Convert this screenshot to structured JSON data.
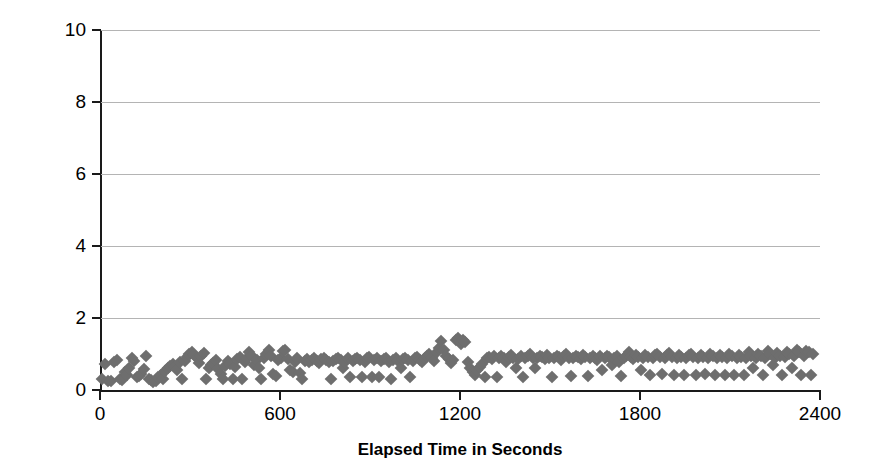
{
  "chart_data": {
    "type": "scatter",
    "title": "",
    "xlabel": "Elapsed Time in Seconds",
    "ylabel": "Maximum Cycle Time in Msec.",
    "xlim": [
      0,
      2400
    ],
    "ylim": [
      0,
      10
    ],
    "xticks": [
      0,
      600,
      1200,
      1800,
      2400
    ],
    "yticks": [
      0,
      2,
      4,
      6,
      8,
      10
    ],
    "xtick_labels": [
      "0",
      "600",
      "1200",
      "1800",
      "2400"
    ],
    "ytick_labels": [
      "0",
      "2",
      "4",
      "6",
      "8",
      "10"
    ],
    "grid": "horizontal",
    "legend": "none",
    "marker": "diamond",
    "marker_color": "#6e6e6e",
    "gridline_color": "#b4b4b4",
    "axis_color": "#1a1a1a",
    "background_color": "#ffffff",
    "series": [
      {
        "name": "Maximum Cycle Time",
        "points": [
          [
            8,
            0.3
          ],
          [
            18,
            0.72
          ],
          [
            28,
            0.25
          ],
          [
            38,
            0.25
          ],
          [
            48,
            0.78
          ],
          [
            58,
            0.82
          ],
          [
            66,
            0.3
          ],
          [
            74,
            0.28
          ],
          [
            82,
            0.5
          ],
          [
            90,
            0.42
          ],
          [
            98,
            0.62
          ],
          [
            106,
            0.88
          ],
          [
            114,
            0.8
          ],
          [
            122,
            0.35
          ],
          [
            130,
            0.4
          ],
          [
            138,
            0.45
          ],
          [
            146,
            0.58
          ],
          [
            154,
            0.95
          ],
          [
            162,
            0.3
          ],
          [
            170,
            0.28
          ],
          [
            178,
            0.22
          ],
          [
            186,
            0.25
          ],
          [
            194,
            0.35
          ],
          [
            202,
            0.42
          ],
          [
            210,
            0.3
          ],
          [
            218,
            0.52
          ],
          [
            226,
            0.6
          ],
          [
            234,
            0.68
          ],
          [
            242,
            0.72
          ],
          [
            250,
            0.65
          ],
          [
            258,
            0.55
          ],
          [
            266,
            0.78
          ],
          [
            274,
            0.3
          ],
          [
            282,
            0.8
          ],
          [
            290,
            0.92
          ],
          [
            298,
            1.0
          ],
          [
            306,
            1.05
          ],
          [
            314,
            0.98
          ],
          [
            322,
            0.88
          ],
          [
            330,
            0.75
          ],
          [
            338,
            0.95
          ],
          [
            346,
            1.02
          ],
          [
            354,
            0.3
          ],
          [
            362,
            0.62
          ],
          [
            370,
            0.7
          ],
          [
            378,
            0.75
          ],
          [
            386,
            0.82
          ],
          [
            394,
            0.58
          ],
          [
            402,
            0.45
          ],
          [
            410,
            0.3
          ],
          [
            418,
            0.68
          ],
          [
            426,
            0.8
          ],
          [
            434,
            0.72
          ],
          [
            442,
            0.3
          ],
          [
            450,
            0.65
          ],
          [
            458,
            0.85
          ],
          [
            466,
            0.92
          ],
          [
            474,
            0.3
          ],
          [
            482,
            0.78
          ],
          [
            490,
            0.88
          ],
          [
            498,
            1.05
          ],
          [
            506,
            0.95
          ],
          [
            514,
            0.7
          ],
          [
            522,
            0.82
          ],
          [
            530,
            0.6
          ],
          [
            538,
            0.3
          ],
          [
            546,
            0.88
          ],
          [
            554,
            1.0
          ],
          [
            562,
            1.1
          ],
          [
            570,
            0.95
          ],
          [
            578,
            0.45
          ],
          [
            586,
            0.4
          ],
          [
            594,
            0.82
          ],
          [
            602,
            0.9
          ],
          [
            610,
            1.08
          ],
          [
            618,
            1.12
          ],
          [
            626,
            0.85
          ],
          [
            634,
            0.55
          ],
          [
            642,
            0.5
          ],
          [
            650,
            0.78
          ],
          [
            658,
            0.88
          ],
          [
            666,
            0.48
          ],
          [
            674,
            0.3
          ],
          [
            682,
            0.8
          ],
          [
            690,
            0.85
          ],
          [
            698,
            0.78
          ],
          [
            706,
            0.82
          ],
          [
            714,
            0.88
          ],
          [
            722,
            0.8
          ],
          [
            730,
            0.75
          ],
          [
            738,
            0.85
          ],
          [
            746,
            0.9
          ],
          [
            754,
            0.82
          ],
          [
            762,
            0.78
          ],
          [
            770,
            0.3
          ],
          [
            778,
            0.8
          ],
          [
            786,
            0.85
          ],
          [
            794,
            0.88
          ],
          [
            802,
            0.82
          ],
          [
            810,
            0.6
          ],
          [
            818,
            0.78
          ],
          [
            826,
            0.88
          ],
          [
            834,
            0.35
          ],
          [
            842,
            0.8
          ],
          [
            850,
            0.85
          ],
          [
            858,
            0.9
          ],
          [
            866,
            0.82
          ],
          [
            874,
            0.35
          ],
          [
            882,
            0.78
          ],
          [
            890,
            0.88
          ],
          [
            898,
            0.92
          ],
          [
            906,
            0.35
          ],
          [
            914,
            0.82
          ],
          [
            922,
            0.88
          ],
          [
            930,
            0.35
          ],
          [
            938,
            0.8
          ],
          [
            946,
            0.85
          ],
          [
            954,
            0.9
          ],
          [
            962,
            0.78
          ],
          [
            970,
            0.3
          ],
          [
            978,
            0.82
          ],
          [
            986,
            0.88
          ],
          [
            994,
            0.8
          ],
          [
            1002,
            0.62
          ],
          [
            1010,
            0.85
          ],
          [
            1018,
            0.9
          ],
          [
            1026,
            0.82
          ],
          [
            1034,
            0.35
          ],
          [
            1042,
            0.8
          ],
          [
            1050,
            0.88
          ],
          [
            1058,
            0.92
          ],
          [
            1066,
            0.82
          ],
          [
            1074,
            0.78
          ],
          [
            1082,
            0.88
          ],
          [
            1090,
            0.95
          ],
          [
            1098,
            1.0
          ],
          [
            1106,
            0.88
          ],
          [
            1114,
            0.8
          ],
          [
            1122,
            1.05
          ],
          [
            1130,
            1.18
          ],
          [
            1138,
            1.35
          ],
          [
            1146,
            1.1
          ],
          [
            1154,
            0.95
          ],
          [
            1162,
            0.85
          ],
          [
            1170,
            0.75
          ],
          [
            1178,
            0.82
          ],
          [
            1186,
            1.4
          ],
          [
            1194,
            1.45
          ],
          [
            1202,
            1.28
          ],
          [
            1210,
            1.38
          ],
          [
            1218,
            1.32
          ],
          [
            1226,
            0.78
          ],
          [
            1234,
            0.6
          ],
          [
            1242,
            0.5
          ],
          [
            1250,
            0.42
          ],
          [
            1258,
            0.55
          ],
          [
            1266,
            0.65
          ],
          [
            1274,
            0.72
          ],
          [
            1282,
            0.35
          ],
          [
            1290,
            0.88
          ],
          [
            1298,
            0.92
          ],
          [
            1306,
            0.85
          ],
          [
            1314,
            0.95
          ],
          [
            1322,
            0.35
          ],
          [
            1330,
            0.9
          ],
          [
            1338,
            0.95
          ],
          [
            1346,
            0.88
          ],
          [
            1354,
            0.78
          ],
          [
            1362,
            0.92
          ],
          [
            1370,
            0.98
          ],
          [
            1378,
            0.9
          ],
          [
            1386,
            0.62
          ],
          [
            1394,
            0.85
          ],
          [
            1402,
            0.95
          ],
          [
            1410,
            0.35
          ],
          [
            1418,
            0.88
          ],
          [
            1426,
            0.95
          ],
          [
            1434,
            1.0
          ],
          [
            1442,
            0.9
          ],
          [
            1450,
            0.6
          ],
          [
            1458,
            0.88
          ],
          [
            1466,
            0.95
          ],
          [
            1474,
            0.92
          ],
          [
            1482,
            0.85
          ],
          [
            1490,
            0.98
          ],
          [
            1498,
            0.9
          ],
          [
            1506,
            0.35
          ],
          [
            1514,
            0.88
          ],
          [
            1522,
            0.95
          ],
          [
            1530,
            0.92
          ],
          [
            1538,
            0.82
          ],
          [
            1546,
            0.95
          ],
          [
            1554,
            1.0
          ],
          [
            1562,
            0.9
          ],
          [
            1570,
            0.38
          ],
          [
            1578,
            0.88
          ],
          [
            1586,
            0.95
          ],
          [
            1594,
            0.92
          ],
          [
            1602,
            0.85
          ],
          [
            1610,
            0.98
          ],
          [
            1618,
            0.92
          ],
          [
            1626,
            0.38
          ],
          [
            1634,
            0.88
          ],
          [
            1642,
            0.95
          ],
          [
            1650,
            0.9
          ],
          [
            1658,
            0.82
          ],
          [
            1666,
            0.95
          ],
          [
            1674,
            0.55
          ],
          [
            1682,
            0.88
          ],
          [
            1690,
            0.95
          ],
          [
            1698,
            0.92
          ],
          [
            1706,
            0.7
          ],
          [
            1714,
            0.88
          ],
          [
            1722,
            0.95
          ],
          [
            1730,
            0.78
          ],
          [
            1738,
            0.4
          ],
          [
            1746,
            0.88
          ],
          [
            1754,
            0.95
          ],
          [
            1762,
            1.05
          ],
          [
            1770,
            0.92
          ],
          [
            1778,
            0.85
          ],
          [
            1786,
            0.98
          ],
          [
            1794,
            0.92
          ],
          [
            1802,
            0.55
          ],
          [
            1810,
            0.88
          ],
          [
            1818,
            0.98
          ],
          [
            1826,
            0.92
          ],
          [
            1834,
            0.42
          ],
          [
            1842,
            0.88
          ],
          [
            1850,
            0.98
          ],
          [
            1858,
            1.0
          ],
          [
            1866,
            0.92
          ],
          [
            1874,
            0.45
          ],
          [
            1882,
            0.9
          ],
          [
            1890,
            0.98
          ],
          [
            1898,
            1.02
          ],
          [
            1906,
            0.92
          ],
          [
            1914,
            0.42
          ],
          [
            1922,
            0.88
          ],
          [
            1930,
            0.98
          ],
          [
            1938,
            0.92
          ],
          [
            1946,
            0.42
          ],
          [
            1954,
            0.9
          ],
          [
            1962,
            0.98
          ],
          [
            1970,
            1.0
          ],
          [
            1978,
            0.92
          ],
          [
            1986,
            0.42
          ],
          [
            1994,
            0.88
          ],
          [
            2002,
            0.98
          ],
          [
            2010,
            0.92
          ],
          [
            2018,
            0.45
          ],
          [
            2026,
            0.9
          ],
          [
            2034,
            1.0
          ],
          [
            2042,
            0.95
          ],
          [
            2050,
            0.42
          ],
          [
            2058,
            0.88
          ],
          [
            2066,
            0.98
          ],
          [
            2074,
            0.92
          ],
          [
            2082,
            0.42
          ],
          [
            2090,
            0.9
          ],
          [
            2098,
            1.0
          ],
          [
            2106,
            0.95
          ],
          [
            2114,
            0.42
          ],
          [
            2122,
            0.88
          ],
          [
            2130,
            0.98
          ],
          [
            2138,
            0.92
          ],
          [
            2146,
            0.42
          ],
          [
            2154,
            0.9
          ],
          [
            2162,
            1.05
          ],
          [
            2170,
            0.95
          ],
          [
            2178,
            0.62
          ],
          [
            2186,
            0.88
          ],
          [
            2194,
            1.0
          ],
          [
            2202,
            0.95
          ],
          [
            2210,
            0.42
          ],
          [
            2218,
            0.9
          ],
          [
            2226,
            1.08
          ],
          [
            2234,
            1.0
          ],
          [
            2242,
            0.7
          ],
          [
            2250,
            0.88
          ],
          [
            2258,
            1.02
          ],
          [
            2266,
            0.95
          ],
          [
            2274,
            0.42
          ],
          [
            2282,
            0.92
          ],
          [
            2290,
            1.05
          ],
          [
            2298,
            1.0
          ],
          [
            2306,
            0.6
          ],
          [
            2314,
            0.95
          ],
          [
            2322,
            1.1
          ],
          [
            2330,
            1.05
          ],
          [
            2338,
            0.42
          ],
          [
            2346,
            0.95
          ],
          [
            2354,
            1.08
          ],
          [
            2362,
            1.05
          ],
          [
            2370,
            0.42
          ],
          [
            2378,
            1.0
          ]
        ]
      }
    ]
  }
}
